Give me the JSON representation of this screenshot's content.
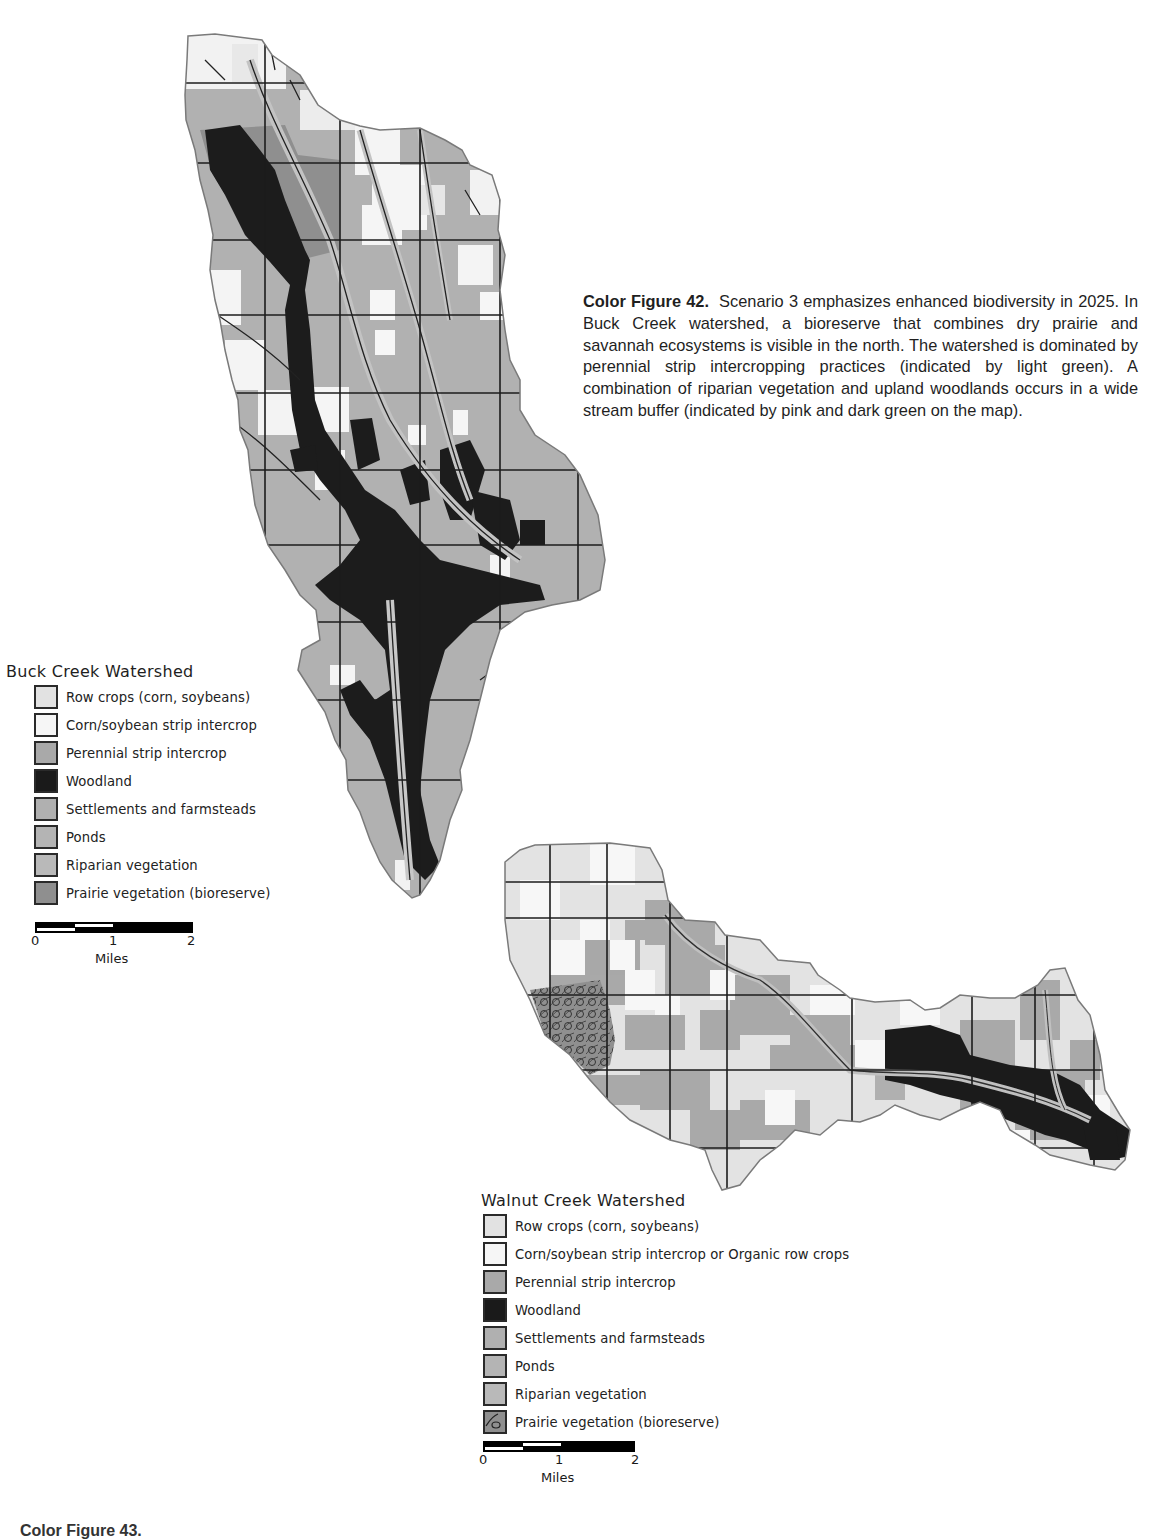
{
  "caption": {
    "figure_label": "Color Figure 42.",
    "text": "Scenario 3 emphasizes enhanced biodiversity in 2025. In Buck Creek watershed, a bioreserve that combines dry prairie and savannah ecosystems is visible in the north. The watershed is dominated by perennial strip intercropping practices (indicated by light green). A combination of riparian vegetation and upland woodlands occurs in a wide stream buffer (indicated by pink and dark green on the map)."
  },
  "colors": {
    "row_crops": "#e2e2e2",
    "strip_intercrop": "#f6f6f6",
    "perennial": "#a9a9a9",
    "woodland": "#1a1a1a",
    "settlements": "#b0b0b0",
    "ponds": "#b4b4b4",
    "riparian": "#b9b9b9",
    "prairie": "#8f8f8f",
    "outline": "#7a7a7a",
    "grid": "#1c1c1c"
  },
  "buck_creek": {
    "title": "Buck Creek Watershed",
    "legend": [
      {
        "label": "Row crops (corn, soybeans)",
        "color": "#e2e2e2"
      },
      {
        "label": "Corn/soybean strip intercrop",
        "color": "#f6f6f6"
      },
      {
        "label": "Perennial strip intercrop",
        "color": "#a9a9a9"
      },
      {
        "label": "Woodland",
        "color": "#1a1a1a"
      },
      {
        "label": "Settlements and farmsteads",
        "color": "#b0b0b0"
      },
      {
        "label": "Ponds",
        "color": "#b4b4b4"
      },
      {
        "label": "Riparian vegetation",
        "color": "#b9b9b9"
      },
      {
        "label": "Prairie vegetation (bioreserve)",
        "color": "#8f8f8f"
      }
    ],
    "scale": {
      "ticks": [
        "0",
        "1",
        "2"
      ],
      "unit": "Miles"
    }
  },
  "walnut_creek": {
    "title": "Walnut Creek Watershed",
    "legend": [
      {
        "label": "Row crops (corn, soybeans)",
        "color": "#e2e2e2"
      },
      {
        "label": "Corn/soybean strip intercrop or Organic row crops",
        "color": "#f6f6f6"
      },
      {
        "label": "Perennial strip intercrop",
        "color": "#a9a9a9"
      },
      {
        "label": "Woodland",
        "color": "#1a1a1a"
      },
      {
        "label": "Settlements and farmsteads",
        "color": "#b0b0b0"
      },
      {
        "label": "Ponds",
        "color": "#b4b4b4"
      },
      {
        "label": "Riparian vegetation",
        "color": "#b9b9b9"
      },
      {
        "label": "Prairie vegetation (bioreserve)",
        "color": "#8f8f8f",
        "pattern": "prairie-hatch"
      }
    ],
    "scale": {
      "ticks": [
        "0",
        "1",
        "2"
      ],
      "unit": "Miles"
    }
  },
  "footer": {
    "cut_off_caption": "Color Figure 43."
  }
}
